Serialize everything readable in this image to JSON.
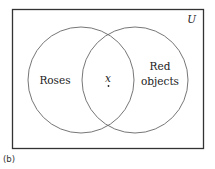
{
  "diagram": {
    "universe_label": "U",
    "sets": [
      {
        "name": "Roses",
        "label_lines": [
          "Roses"
        ]
      },
      {
        "name": "Red objects",
        "label_lines": [
          "Red",
          "objects"
        ]
      }
    ],
    "element": {
      "label": "x",
      "region": "intersection"
    },
    "caption": "(b)",
    "colors": {
      "stroke": "#555555",
      "frame": "#333333",
      "text": "#222222"
    }
  }
}
